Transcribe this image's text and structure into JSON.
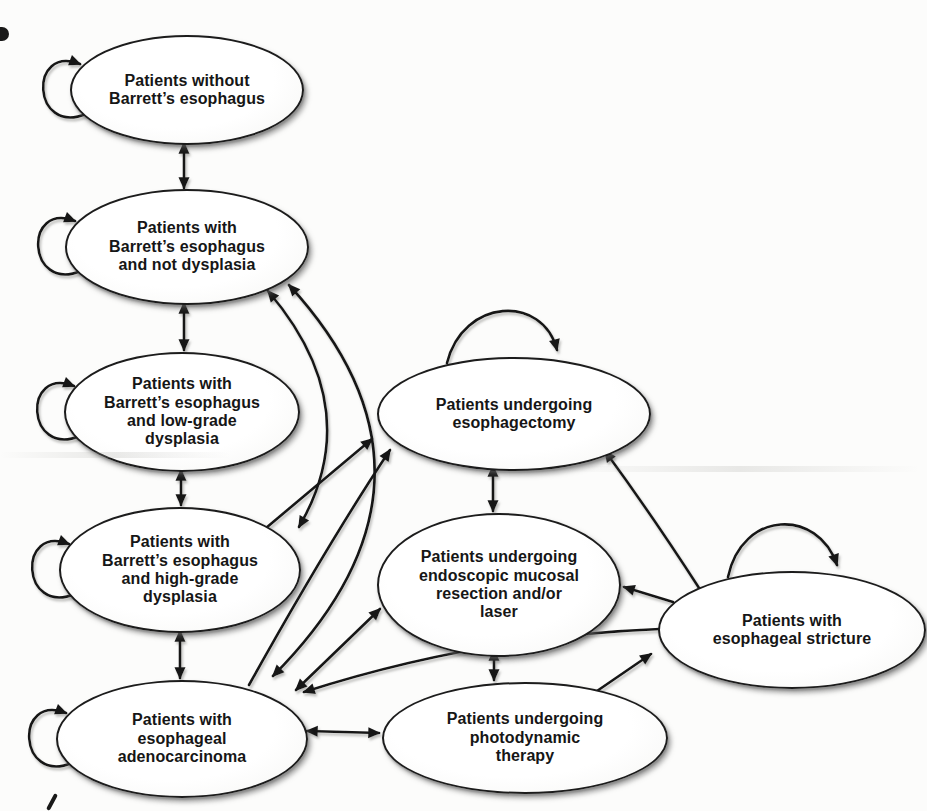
{
  "figure": {
    "ink_color": "#181818",
    "node_fill": "#ffffff",
    "background": "#fcfcfb"
  },
  "nodes": [
    {
      "id": "no-barretts",
      "label": [
        "Patients without",
        "Barrett’s esophagus"
      ],
      "cx": 185,
      "cy": 88,
      "rx": 115,
      "ry": 53
    },
    {
      "id": "barretts-no-dysplasia",
      "label": [
        "Patients with",
        "Barrett’s esophagus",
        "and not dysplasia"
      ],
      "cx": 185,
      "cy": 245,
      "rx": 120,
      "ry": 56
    },
    {
      "id": "barretts-low-grade",
      "label": [
        "Patients with",
        "Barrett’s esophagus",
        "and low-grade",
        "dysplasia"
      ],
      "cx": 180,
      "cy": 410,
      "rx": 116,
      "ry": 58
    },
    {
      "id": "barretts-high-grade",
      "label": [
        "Patients with",
        "Barrett’s esophagus",
        "and high-grade",
        "dysplasia"
      ],
      "cx": 178,
      "cy": 568,
      "rx": 119,
      "ry": 61
    },
    {
      "id": "adenocarcinoma",
      "label": [
        "Patients with",
        "esophageal",
        "adenocarcinoma"
      ],
      "cx": 180,
      "cy": 737,
      "rx": 124,
      "ry": 57
    },
    {
      "id": "esophagectomy",
      "label": [
        "Patients undergoing",
        "esophagectomy"
      ],
      "cx": 512,
      "cy": 412,
      "rx": 135,
      "ry": 55
    },
    {
      "id": "emr-laser",
      "label": [
        "Patients undergoing",
        "endoscopic mucosal",
        "resection and/or",
        "laser"
      ],
      "cx": 497,
      "cy": 583,
      "rx": 120,
      "ry": 70
    },
    {
      "id": "photodynamic",
      "label": [
        "Patients undergoing",
        "photodynamic",
        "therapy"
      ],
      "cx": 523,
      "cy": 736,
      "rx": 141,
      "ry": 54
    },
    {
      "id": "stricture",
      "label": [
        "Patients with",
        "esophageal stricture"
      ],
      "cx": 790,
      "cy": 628,
      "rx": 132,
      "ry": 57
    }
  ],
  "edges": [
    {
      "from": "no-barretts",
      "to": "barretts-no-dysplasia",
      "bidirectional": true,
      "path": "M 184,143 L 184,188"
    },
    {
      "from": "barretts-no-dysplasia",
      "to": "barretts-low-grade",
      "bidirectional": true,
      "path": "M 184,303 L 184,350"
    },
    {
      "from": "barretts-low-grade",
      "to": "barretts-high-grade",
      "bidirectional": true,
      "path": "M 181,470 L 181,505"
    },
    {
      "from": "barretts-high-grade",
      "to": "adenocarcinoma",
      "bidirectional": true,
      "path": "M 180,631 L 180,678"
    },
    {
      "from": "barretts-no-dysplasia",
      "to": "barretts-high-grade",
      "bidirectional": true,
      "path": "M 268,291 Q 368,408 299,527"
    },
    {
      "from": "barretts-no-dysplasia",
      "to": "adenocarcinoma",
      "bidirectional": true,
      "path": "M 289,285 Q 468,480 273,676"
    },
    {
      "from": "barretts-high-grade",
      "to": "esophagectomy",
      "bidirectional": false,
      "path": "M 266,528 L 372,439"
    },
    {
      "from": "adenocarcinoma",
      "to": "esophagectomy",
      "bidirectional": false,
      "path": "M 249,685 Q 327,545 390,450"
    },
    {
      "from": "esophagectomy",
      "to": "emr-laser",
      "bidirectional": true,
      "path": "M 493,466 L 493,511"
    },
    {
      "from": "emr-laser",
      "to": "photodynamic",
      "bidirectional": true,
      "path": "M 494,650 L 494,680"
    },
    {
      "from": "adenocarcinoma",
      "to": "emr-laser",
      "bidirectional": true,
      "path": "M 296,690 L 380,609"
    },
    {
      "from": "adenocarcinoma",
      "to": "photodynamic",
      "bidirectional": true,
      "path": "M 307,731 L 379,733"
    },
    {
      "from": "photodynamic",
      "to": "stricture",
      "bidirectional": false,
      "path": "M 597,691 L 651,654"
    },
    {
      "from": "stricture",
      "to": "esophagectomy",
      "bidirectional": false,
      "path": "M 701,591 Q 652,515 605,451"
    },
    {
      "from": "stricture",
      "to": "emr-laser",
      "bidirectional": false,
      "path": "M 673,602 L 624,587"
    },
    {
      "from": "stricture",
      "to": "adenocarcinoma",
      "bidirectional": false,
      "path": "M 660,629 Q 478,636 304,692"
    }
  ],
  "self_loops": [
    {
      "node": "no-barretts",
      "path": "M 86,114 C 32,136 28,44 80,64"
    },
    {
      "node": "barretts-no-dysplasia",
      "path": "M 81,271 C 27,293 23,201 75,221"
    },
    {
      "node": "barretts-low-grade",
      "path": "M 80,436 C 26,458 22,366 74,386"
    },
    {
      "node": "barretts-high-grade",
      "path": "M 75,594 C 21,616 17,524 69,544"
    },
    {
      "node": "adenocarcinoma",
      "path": "M 72,763 C 18,785 14,693 66,713"
    },
    {
      "node": "esophagectomy",
      "path": "M 447,363 C 463,298 543,294 557,350"
    },
    {
      "node": "stricture",
      "path": "M 728,577 C 742,510 818,508 837,565"
    }
  ],
  "artifacts": {
    "top_left_mark": "scan blemish",
    "bottom_left_mark": "scan blemish"
  }
}
